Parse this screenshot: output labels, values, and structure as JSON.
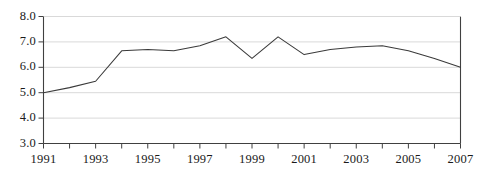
{
  "chart_data": {
    "type": "line",
    "title": "",
    "subtitle": "",
    "xlabel": "",
    "ylabel": "",
    "x": [
      1991,
      1992,
      1993,
      1994,
      1995,
      1996,
      1997,
      1998,
      1999,
      2000,
      2001,
      2002,
      2003,
      2004,
      2005,
      2006,
      2007
    ],
    "values": [
      5.0,
      5.2,
      5.45,
      6.65,
      6.7,
      6.65,
      6.85,
      7.2,
      6.35,
      7.2,
      6.5,
      6.7,
      6.8,
      6.85,
      6.65,
      6.35,
      6.0
    ],
    "series": [
      {
        "name": "series-1",
        "color": "#3a3a3a",
        "values": [
          5.0,
          5.2,
          5.45,
          6.65,
          6.7,
          6.65,
          6.85,
          7.2,
          6.35,
          7.2,
          6.5,
          6.7,
          6.8,
          6.85,
          6.65,
          6.35,
          6.0
        ]
      }
    ],
    "xlim": [
      1991,
      2007
    ],
    "ylim": [
      3.0,
      8.0
    ],
    "ytick_labels": [
      "8.0",
      "7.0",
      "6.0",
      "5.0",
      "4.0",
      "3.0"
    ],
    "ytick_values": [
      8.0,
      7.0,
      6.0,
      5.0,
      4.0,
      3.0
    ],
    "xtick_values": [
      1991,
      1992,
      1993,
      1994,
      1995,
      1996,
      1997,
      1998,
      1999,
      2000,
      2001,
      2002,
      2003,
      2004,
      2005,
      2006,
      2007
    ],
    "xtick_labels": [
      "1991",
      "",
      "1993",
      "",
      "1995",
      "",
      "1997",
      "",
      "1999",
      "",
      "2001",
      "",
      "2003",
      "",
      "2005",
      "",
      "2007"
    ],
    "xtick_labels_shown": [
      "1991",
      "1993",
      "1995",
      "1997",
      "1999",
      "2001",
      "2003",
      "2005",
      "2007"
    ],
    "grid": "horizontal",
    "grid_color": "#d9d9d9",
    "axis_color": "#404040",
    "legend": "none",
    "legend_position": "none",
    "annotations": []
  }
}
